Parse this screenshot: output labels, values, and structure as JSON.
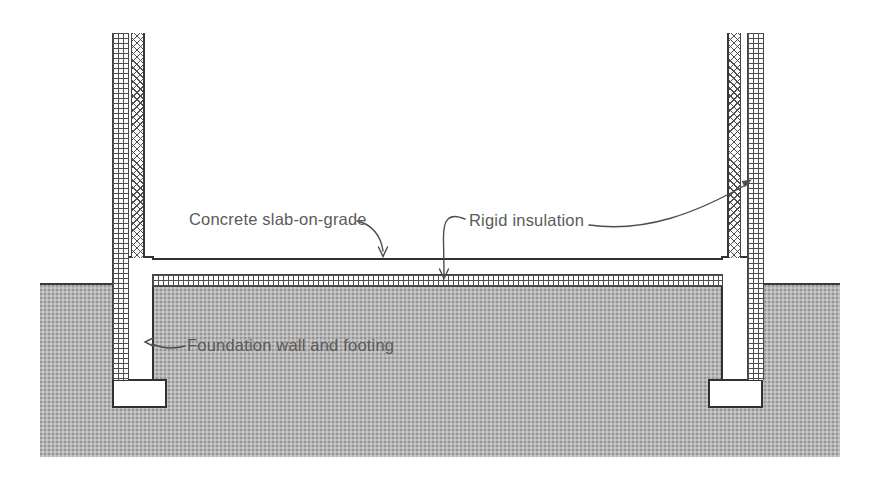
{
  "diagram": {
    "labels": {
      "concrete_slab": "Concrete slab-on-grade",
      "rigid_insulation": "Rigid insulation",
      "foundation": "Foundation wall and footing"
    },
    "colors": {
      "ink": "#3a3a3a",
      "label_text": "#5a5a5a",
      "ground_fill": "#b6b6b6",
      "background": "#ffffff"
    }
  }
}
